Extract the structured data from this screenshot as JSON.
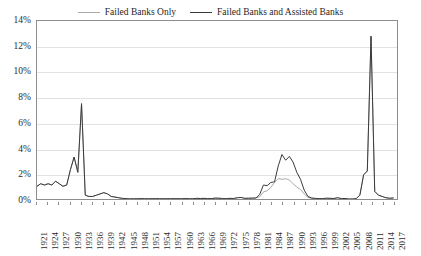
{
  "chart_data": {
    "type": "line",
    "title": "",
    "xlabel": "",
    "ylabel": "",
    "ylim": [
      0,
      14
    ],
    "xlim": [
      1921,
      2018
    ],
    "grid": true,
    "legend_position": "top-center",
    "ytick_labels": [
      "0%",
      "2%",
      "4%",
      "6%",
      "8%",
      "10%",
      "12%",
      "14%"
    ],
    "ytick_values": [
      0,
      2,
      4,
      6,
      8,
      10,
      12,
      14
    ],
    "xtick_labels": [
      "1921",
      "1924",
      "1927",
      "1930",
      "1933",
      "1936",
      "1939",
      "1942",
      "1945",
      "1948",
      "1951",
      "1954",
      "1957",
      "1960",
      "1963",
      "1966",
      "1969",
      "1972",
      "1975",
      "1978",
      "1981",
      "1984",
      "1987",
      "1990",
      "1993",
      "1996",
      "1999",
      "2002",
      "2005",
      "2008",
      "2011",
      "2014",
      "2017"
    ],
    "xtick_values": [
      1921,
      1924,
      1927,
      1930,
      1933,
      1936,
      1939,
      1942,
      1945,
      1948,
      1951,
      1954,
      1957,
      1960,
      1963,
      1966,
      1969,
      1972,
      1975,
      1978,
      1981,
      1984,
      1987,
      1990,
      1993,
      1996,
      1999,
      2002,
      2005,
      2008,
      2011,
      2014,
      2017
    ],
    "series": [
      {
        "name": "Failed Banks Only",
        "color": "#a8a8a8",
        "x": [
          1921,
          1922,
          1923,
          1924,
          1925,
          1926,
          1927,
          1928,
          1929,
          1930,
          1931,
          1932,
          1933,
          1934,
          1935,
          1936,
          1937,
          1938,
          1939,
          1940,
          1941,
          1942,
          1943,
          1944,
          1945,
          1946,
          1947,
          1948,
          1949,
          1950,
          1951,
          1952,
          1953,
          1954,
          1955,
          1956,
          1957,
          1958,
          1959,
          1960,
          1961,
          1962,
          1963,
          1964,
          1965,
          1966,
          1967,
          1968,
          1969,
          1970,
          1971,
          1972,
          1973,
          1974,
          1975,
          1976,
          1977,
          1978,
          1979,
          1980,
          1981,
          1982,
          1983,
          1984,
          1985,
          1986,
          1987,
          1988,
          1989,
          1990,
          1991,
          1992,
          1993,
          1994,
          1995,
          1996,
          1997,
          1998,
          1999,
          2000,
          2001,
          2002,
          2003,
          2004,
          2005,
          2006,
          2007,
          2008,
          2009,
          2010,
          2011,
          2012,
          2013,
          2014,
          2015,
          2016,
          2017
        ],
        "y": [
          1.0,
          1.2,
          1.1,
          1.2,
          1.1,
          1.4,
          1.2,
          1.0,
          1.1,
          2.3,
          3.3,
          2.1,
          7.5,
          0.3,
          0.2,
          0.2,
          0.3,
          0.4,
          0.5,
          0.4,
          0.2,
          0.15,
          0.1,
          0.05,
          0.03,
          0.01,
          0.02,
          0.02,
          0.03,
          0.02,
          0.02,
          0.02,
          0.03,
          0.02,
          0.02,
          0.02,
          0.02,
          0.03,
          0.02,
          0.02,
          0.04,
          0.02,
          0.02,
          0.05,
          0.04,
          0.05,
          0.03,
          0.03,
          0.07,
          0.06,
          0.04,
          0.03,
          0.05,
          0.04,
          0.1,
          0.12,
          0.05,
          0.06,
          0.07,
          0.08,
          0.18,
          0.55,
          0.65,
          0.9,
          1.3,
          1.6,
          1.55,
          1.6,
          1.5,
          1.2,
          0.95,
          0.75,
          0.4,
          0.12,
          0.05,
          0.04,
          0.02,
          0.03,
          0.06,
          0.05,
          0.04,
          0.1,
          0.03,
          0.04,
          0.0,
          0.0,
          0.03,
          0.3,
          1.9,
          2.2,
          12.8,
          0.6,
          0.3,
          0.2,
          0.1,
          0.06,
          0.08
        ]
      },
      {
        "name": "Failed Banks and Assisted Banks",
        "color": "#3a3a3a",
        "x": [
          1921,
          1922,
          1923,
          1924,
          1925,
          1926,
          1927,
          1928,
          1929,
          1930,
          1931,
          1932,
          1933,
          1934,
          1935,
          1936,
          1937,
          1938,
          1939,
          1940,
          1941,
          1942,
          1943,
          1944,
          1945,
          1946,
          1947,
          1948,
          1949,
          1950,
          1951,
          1952,
          1953,
          1954,
          1955,
          1956,
          1957,
          1958,
          1959,
          1960,
          1961,
          1962,
          1963,
          1964,
          1965,
          1966,
          1967,
          1968,
          1969,
          1970,
          1971,
          1972,
          1973,
          1974,
          1975,
          1976,
          1977,
          1978,
          1979,
          1980,
          1981,
          1982,
          1983,
          1984,
          1985,
          1986,
          1987,
          1988,
          1989,
          1990,
          1991,
          1992,
          1993,
          1994,
          1995,
          1996,
          1997,
          1998,
          1999,
          2000,
          2001,
          2002,
          2003,
          2004,
          2005,
          2006,
          2007,
          2008,
          2009,
          2010,
          2011,
          2012,
          2013,
          2014,
          2015,
          2016,
          2017
        ],
        "y": [
          1.0,
          1.2,
          1.1,
          1.2,
          1.1,
          1.4,
          1.2,
          1.0,
          1.1,
          2.3,
          3.3,
          2.1,
          7.5,
          0.3,
          0.2,
          0.2,
          0.3,
          0.4,
          0.5,
          0.4,
          0.2,
          0.15,
          0.1,
          0.05,
          0.03,
          0.01,
          0.02,
          0.02,
          0.03,
          0.02,
          0.02,
          0.02,
          0.03,
          0.02,
          0.02,
          0.02,
          0.02,
          0.03,
          0.02,
          0.02,
          0.04,
          0.02,
          0.02,
          0.05,
          0.04,
          0.05,
          0.03,
          0.03,
          0.07,
          0.06,
          0.04,
          0.03,
          0.05,
          0.04,
          0.1,
          0.12,
          0.05,
          0.06,
          0.07,
          0.08,
          0.35,
          1.1,
          1.05,
          1.3,
          1.35,
          2.6,
          3.5,
          3.05,
          3.35,
          2.9,
          2.1,
          1.55,
          0.7,
          0.2,
          0.08,
          0.05,
          0.03,
          0.03,
          0.06,
          0.05,
          0.04,
          0.1,
          0.03,
          0.04,
          0.0,
          0.0,
          0.03,
          0.3,
          1.9,
          2.2,
          12.8,
          0.6,
          0.3,
          0.2,
          0.1,
          0.06,
          0.08
        ]
      }
    ]
  },
  "legend": {
    "items": [
      {
        "label": "Failed Banks Only",
        "color": "#a8a8a8"
      },
      {
        "label": "Failed Banks and Assisted Banks",
        "color": "#3a3a3a"
      }
    ]
  }
}
